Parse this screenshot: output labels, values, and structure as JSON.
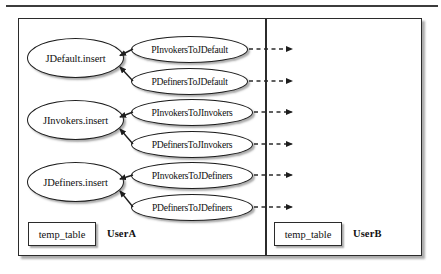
{
  "diagram": {
    "title_present": false,
    "panes": [
      {
        "id": "userA",
        "label": "UserA"
      },
      {
        "id": "userB",
        "label": "UserB"
      }
    ],
    "job_nodes": [
      {
        "label": "JDefault.insert"
      },
      {
        "label": "JInvokers.insert"
      },
      {
        "label": "JDefiners.insert"
      }
    ],
    "procedure_nodes": [
      {
        "label": "PInvokersToJDefault"
      },
      {
        "label": "PDefinersToJDefault"
      },
      {
        "label": "PInvokersToJInvokers"
      },
      {
        "label": "PDefinersToJInvokers"
      },
      {
        "label": "PInvokersToJDefiners"
      },
      {
        "label": "PDefinersToJDefiners"
      }
    ],
    "temp_tables": [
      {
        "label": "temp_table",
        "pane": "userA"
      },
      {
        "label": "temp_table",
        "pane": "userB"
      }
    ],
    "edges": {
      "solid_arrow_name": "solid-arrow-to-job",
      "dashed_arrow_name": "dashed-arrow-across-divider",
      "dashed_arrow_count": 6,
      "solid_arrow_count": 6
    },
    "colors": {
      "stroke": "#1d1d1d",
      "box_stroke": "#2b2b2b",
      "fill": "#ffffff",
      "background": "#ffffff",
      "shadow": "rgba(90,90,90,0.5)"
    }
  }
}
